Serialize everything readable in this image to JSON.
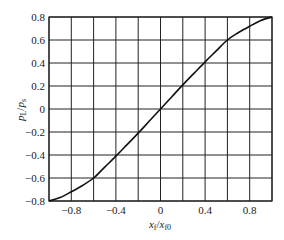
{
  "chart_data": {
    "type": "line",
    "title": "",
    "xlabel": "x_f/x_f0",
    "ylabel": "p_L/p_s",
    "xlabel_parts": {
      "main": "x",
      "sub": "f",
      "sep": "/",
      "main2": "x",
      "sub2": "f0"
    },
    "ylabel_parts": {
      "main": "p",
      "sub": "L",
      "sep": "/",
      "main2": "p",
      "sub2": "s"
    },
    "xlim": [
      -1.0,
      1.0
    ],
    "ylim": [
      -0.8,
      0.8
    ],
    "xticks": [
      -0.8,
      -0.4,
      0,
      0.4,
      0.8
    ],
    "xtick_labels": [
      "-0.8",
      "-0.4",
      "0",
      "0.4",
      "0.8"
    ],
    "yticks": [
      0.8,
      0.6,
      0.4,
      0.2,
      0,
      -0.2,
      -0.4,
      -0.6,
      -0.8
    ],
    "ytick_labels": [
      "0.8",
      "0.6",
      "0.4",
      "0.2",
      "0",
      "-0.2",
      "-0.4",
      "-0.6",
      "-0.8"
    ],
    "grid": {
      "x_step": 0.2,
      "y_step": 0.2,
      "on": true
    },
    "legend": null,
    "series": [
      {
        "name": "p_L/p_s vs x_f/x_f0",
        "x": [
          -1.0,
          -0.9,
          -0.8,
          -0.7,
          -0.6,
          -0.5,
          -0.4,
          -0.3,
          -0.2,
          -0.1,
          0.0,
          0.1,
          0.2,
          0.3,
          0.4,
          0.5,
          0.6,
          0.7,
          0.8,
          0.9,
          1.0
        ],
        "y": [
          -0.8,
          -0.77,
          -0.72,
          -0.665,
          -0.6,
          -0.505,
          -0.41,
          -0.31,
          -0.21,
          -0.105,
          0.0,
          0.105,
          0.21,
          0.31,
          0.41,
          0.505,
          0.6,
          0.665,
          0.72,
          0.77,
          0.8
        ]
      }
    ]
  }
}
